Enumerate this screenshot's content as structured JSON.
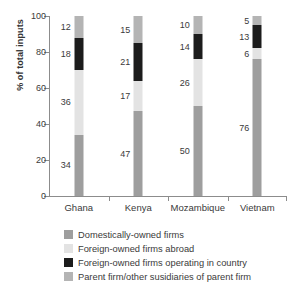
{
  "chart_data": {
    "type": "bar",
    "title": "",
    "subtitle": "",
    "xlabel": "",
    "ylabel": "% of total inputs",
    "ylim": [
      0,
      100
    ],
    "yticks": [
      0,
      20,
      40,
      60,
      80,
      100
    ],
    "grid": false,
    "stacked": true,
    "stack_total": 100,
    "legend_position": "bottom",
    "categories": [
      "Ghana",
      "Kenya",
      "Mozambique",
      "Vietnam"
    ],
    "series": [
      {
        "name": "Domestically-owned firms",
        "color": "#9e9e9e",
        "values": [
          34,
          47,
          50,
          76
        ]
      },
      {
        "name": "Foreign-owned firms abroad",
        "color": "#e3e3e3",
        "values": [
          36,
          17,
          26,
          6
        ]
      },
      {
        "name": "Foreign-owned firms operating in country",
        "color": "#1c1c1c",
        "values": [
          18,
          21,
          14,
          13
        ]
      },
      {
        "name": "Parent firm/other susidiaries of parent firm",
        "color": "#b4b4b4",
        "values": [
          12,
          15,
          10,
          5
        ]
      }
    ]
  },
  "axis": {
    "y_title": "% of total inputs",
    "y_tick_labels": [
      "0",
      "20",
      "40",
      "60",
      "80",
      "100"
    ],
    "x_tick_labels": [
      "Ghana",
      "Kenya",
      "Mozambique",
      "Vietnam"
    ]
  },
  "legend": {
    "items": [
      {
        "label": "Domestically-owned firms",
        "color": "#9e9e9e"
      },
      {
        "label": "Foreign-owned firms abroad",
        "color": "#e3e3e3"
      },
      {
        "label": "Foreign-owned firms operating in country",
        "color": "#1c1c1c"
      },
      {
        "label": "Parent firm/other susidiaries of parent firm",
        "color": "#b4b4b4"
      }
    ]
  },
  "data_labels": {
    "Ghana": [
      "34",
      "36",
      "18",
      "12"
    ],
    "Kenya": [
      "47",
      "17",
      "21",
      "15"
    ],
    "Mozambique": [
      "50",
      "26",
      "14",
      "10"
    ],
    "Vietnam": [
      "76",
      "6",
      "13",
      "5"
    ]
  },
  "colors": {
    "axis": "#8c8c8c",
    "text": "#3a3a3a",
    "background": "#ffffff"
  }
}
